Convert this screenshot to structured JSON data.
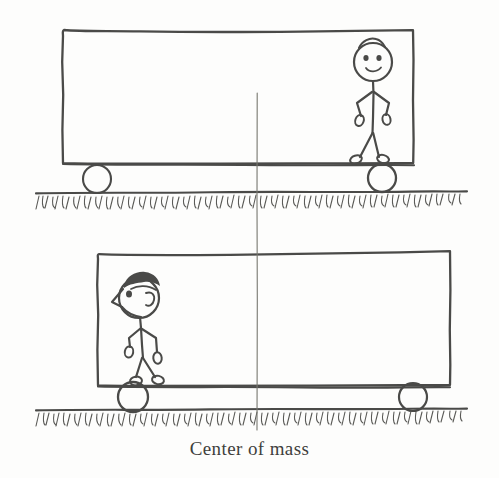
{
  "figure": {
    "caption": "Center of mass",
    "background_color": "#fdfdfc",
    "ink_color": "#4a4a48",
    "com_line_color": "#77776f",
    "panels": [
      {
        "name": "top-panel",
        "description": "Cart with stick figure person standing at the right end, walking left",
        "cart": {
          "left": 62,
          "top": 30,
          "right": 414,
          "bottom": 163
        },
        "wheels": [
          {
            "name": "rear-wheel",
            "cx": 97,
            "cy": 179,
            "r": 14
          },
          {
            "name": "front-wheel",
            "cx": 382,
            "cy": 178,
            "r": 14
          }
        ],
        "ground_y": 192,
        "person": {
          "name": "stick-figure-front-view",
          "facing": "viewer",
          "head_cx": 373,
          "head_cy": 62,
          "head_r": 19,
          "features": "two dot eyes, smiling mouth, bent arms with oval hands, splayed legs with oval feet"
        }
      },
      {
        "name": "bottom-panel",
        "description": "Cart with stick figure person standing at the left end, walking left in profile",
        "cart": {
          "left": 97,
          "top": 254,
          "right": 450,
          "bottom": 385
        },
        "wheels": [
          {
            "name": "rear-wheel",
            "cx": 133,
            "cy": 397,
            "r": 15
          },
          {
            "name": "front-wheel",
            "cx": 413,
            "cy": 397,
            "r": 14
          }
        ],
        "ground_y": 409,
        "person": {
          "name": "stick-figure-profile-view",
          "facing": "left",
          "head_cx": 137,
          "head_cy": 298,
          "head_r": 20,
          "features": "dark hair patch, pointed profile nose, single eye, ear, bent arms with oval hands, legs with oval feet"
        }
      }
    ],
    "com_line": {
      "name": "center-of-mass-line",
      "x": 257,
      "y_top": 93,
      "y_bottom": 430
    }
  }
}
